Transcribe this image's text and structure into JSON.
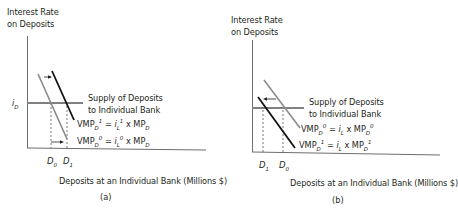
{
  "figure": {
    "panels": [
      {
        "id": "a",
        "caption": "(a)",
        "y_axis_label_line1": "Interest Rate",
        "y_axis_label_line2": "on Deposits",
        "x_axis_label": "Deposits at an Individual Bank (Millions $)",
        "y_tick_label": "i",
        "y_tick_sub": "D",
        "supply_label_line1": "Supply of Deposits",
        "supply_label_line2": "to Individual Bank",
        "curve_top": {
          "name": "VMP",
          "sub1": "D",
          "sup1": "1",
          "eq": " = ",
          "rhs_var": "i",
          "rhs_sub": "L",
          "rhs_sup": "1",
          "times": " x MP",
          "mp_sub": "D",
          "mp_sup": ""
        },
        "curve_bottom": {
          "name": "VMP",
          "sub1": "D",
          "sup1": "0",
          "eq": " = ",
          "rhs_var": "i",
          "rhs_sub": "L",
          "rhs_sup": "0",
          "times": " x MP",
          "mp_sub": "D",
          "mp_sup": ""
        },
        "x_ticks": [
          {
            "var": "D",
            "sub": "0"
          },
          {
            "var": "D",
            "sub": "1"
          }
        ],
        "shift_direction": "right"
      },
      {
        "id": "b",
        "caption": "(b)",
        "y_axis_label_line1": "Interest Rate",
        "y_axis_label_line2": "on Deposits",
        "x_axis_label": "Deposits at an Individual Bank (Millions $)",
        "supply_label_line1": "Supply of Deposits",
        "supply_label_line2": "to Individual Bank",
        "curve_top": {
          "name": "VMP",
          "sub1": "D",
          "sup1": "0",
          "eq": " = ",
          "rhs_var": "i",
          "rhs_sub": "L",
          "rhs_sup": "",
          "times": " x MP",
          "mp_sub": "D",
          "mp_sup": "0"
        },
        "curve_bottom": {
          "name": "VMP",
          "sub1": "D",
          "sup1": "1",
          "eq": " = ",
          "rhs_var": "i",
          "rhs_sub": "L",
          "rhs_sup": "",
          "times": " x MP",
          "mp_sub": "D",
          "mp_sup": "1"
        },
        "x_ticks": [
          {
            "var": "D",
            "sub": "1"
          },
          {
            "var": "D",
            "sub": "0"
          }
        ],
        "shift_direction": "left"
      }
    ],
    "colors": {
      "axis": "#231f20",
      "supply_line": "#808080",
      "initial_curve": "#8a8a8a",
      "new_curve": "#111111",
      "dashed": "#555555"
    }
  }
}
